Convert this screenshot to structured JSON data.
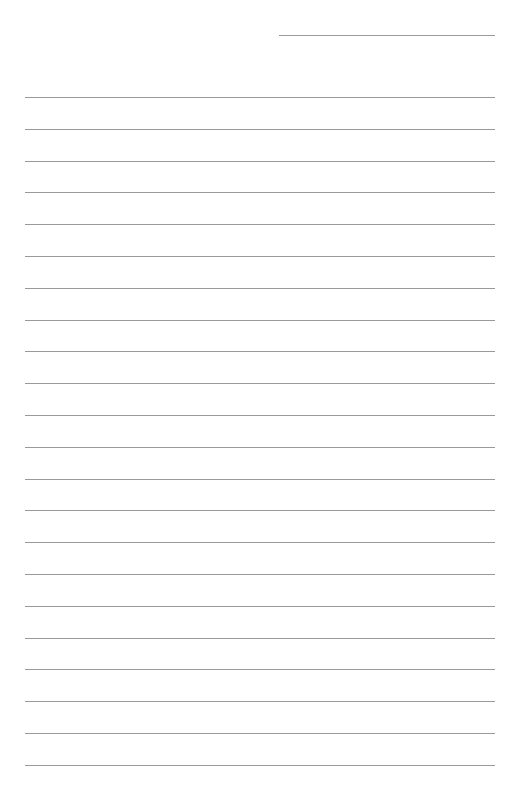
{
  "page": {
    "type": "lined-paper",
    "background": "#ffffff",
    "line_color": "#9a9a9a",
    "header_line": {
      "x": 279,
      "y": 35,
      "width": 216
    },
    "rules": {
      "count": 22,
      "start_y": 97,
      "spacing": 31.8,
      "x": 25,
      "width": 470
    }
  }
}
